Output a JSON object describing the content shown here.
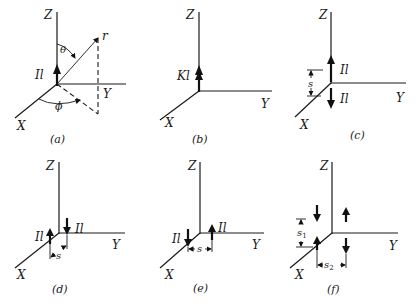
{
  "figure": {
    "axis_labels": {
      "x": "X",
      "y": "Y",
      "z": "Z"
    },
    "panels": [
      {
        "id": "a",
        "caption": "(a)",
        "elements": [
          {
            "label": "Il",
            "direction": "up",
            "location": "origin"
          }
        ],
        "annotations": {
          "radius": "r",
          "polar_angle": "θ",
          "azimuth_angle": "ϕ"
        }
      },
      {
        "id": "b",
        "caption": "(b)",
        "elements": [
          {
            "label": "Kl",
            "direction": "up",
            "location": "origin",
            "style": "double-arrow"
          }
        ]
      },
      {
        "id": "c",
        "caption": "(c)",
        "elements": [
          {
            "label": "Il",
            "direction": "up",
            "location": "+z above origin"
          },
          {
            "label": "Il",
            "direction": "down",
            "location": "below origin"
          }
        ],
        "spacing": {
          "label": "s",
          "axis": "z"
        }
      },
      {
        "id": "d",
        "caption": "(d)",
        "elements": [
          {
            "label": "Il",
            "direction": "up",
            "location": "on x axis"
          },
          {
            "label": "Il",
            "direction": "down",
            "location": "near origin"
          }
        ],
        "spacing": {
          "label": "s",
          "axis": "x"
        }
      },
      {
        "id": "e",
        "caption": "(e)",
        "elements": [
          {
            "label": "Il",
            "direction": "down",
            "location": "on x axis"
          },
          {
            "label": "Il",
            "direction": "up",
            "location": "along y"
          }
        ],
        "spacing": {
          "label": "s",
          "axis": "y"
        }
      },
      {
        "id": "f",
        "caption": "(f)",
        "elements": [
          {
            "direction": "down",
            "location": "upper-left"
          },
          {
            "direction": "up",
            "location": "upper-right"
          },
          {
            "direction": "up",
            "location": "lower-left"
          },
          {
            "direction": "down",
            "location": "lower-right"
          }
        ],
        "spacings": [
          {
            "label": "s1",
            "main": "s",
            "sub": "1",
            "axis": "z"
          },
          {
            "label": "s2",
            "main": "s",
            "sub": "2",
            "axis": "y"
          }
        ]
      }
    ]
  }
}
